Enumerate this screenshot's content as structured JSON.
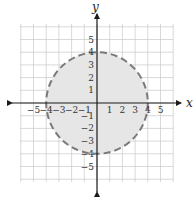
{
  "chart_data": {
    "type": "region",
    "title": "",
    "xlabel": "x",
    "ylabel": "y",
    "xlim": [
      -6,
      6
    ],
    "ylim": [
      -6,
      6
    ],
    "grid": true,
    "x_ticks": [
      -5,
      -4,
      -3,
      -2,
      -1,
      1,
      2,
      3,
      4,
      5
    ],
    "y_ticks": [
      -5,
      -4,
      -3,
      -2,
      -1,
      1,
      2,
      3,
      4,
      5
    ],
    "x_tick_labels": [
      "−5",
      "−4",
      "−3",
      "−2",
      "−1",
      "1",
      "2",
      "3",
      "4",
      "5"
    ],
    "y_tick_labels": [
      "−5",
      "−4",
      "−3",
      "−2",
      "−1",
      "1",
      "2",
      "3",
      "4",
      "5"
    ],
    "shapes": [
      {
        "kind": "circle",
        "center": [
          0,
          0
        ],
        "radius": 4,
        "boundary": "dashed",
        "filled_interior": true,
        "represents": "x^2 + y^2 < 16"
      }
    ]
  },
  "colors": {
    "grid": "#c8c8c8",
    "axis": "#1a1a1a",
    "circle_stroke": "#7a7a7a",
    "circle_fill": "#e6e6e6",
    "plot_bg": "#ffffff"
  }
}
